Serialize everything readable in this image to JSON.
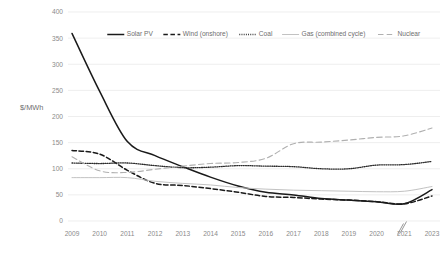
{
  "chart_data": {
    "type": "line",
    "title": "",
    "xlabel": "",
    "ylabel": "$/MWh",
    "ylim": [
      0,
      400
    ],
    "ytick_values": [
      0,
      50,
      100,
      150,
      200,
      250,
      300,
      350,
      400
    ],
    "ytick_labels": [
      "0",
      "50",
      "100",
      "150",
      "200",
      "250",
      "300",
      "350",
      "400"
    ],
    "grid": true,
    "legend_position": "top",
    "axis_break": {
      "label": "zigzag-break",
      "between": [
        "2021",
        "2023"
      ]
    },
    "categories": [
      "2009",
      "2010",
      "2011",
      "2012",
      "2013",
      "2014",
      "2015",
      "2016",
      "2017",
      "2018",
      "2019",
      "2020",
      "2021",
      "2023"
    ],
    "x": [
      2009,
      2010,
      2011,
      2012,
      2013,
      2014,
      2015,
      2016,
      2017,
      2018,
      2019,
      2020,
      2021,
      2023
    ],
    "series": [
      {
        "name": "Solar PV",
        "style": "solid",
        "color": "#1a1a1a",
        "values": [
          359,
          248,
          152,
          125,
          104,
          84,
          67,
          55,
          50,
          43,
          40,
          37,
          33,
          60
        ]
      },
      {
        "name": "Wind (onshore)",
        "style": "dashed",
        "color": "#1a1a1a",
        "values": [
          135,
          128,
          97,
          72,
          68,
          62,
          55,
          47,
          45,
          42,
          40,
          37,
          33,
          48
        ]
      },
      {
        "name": "Coal",
        "style": "dotted",
        "color": "#2b2b2b",
        "values": [
          111,
          110,
          111,
          106,
          102,
          103,
          106,
          105,
          104,
          100,
          100,
          107,
          108,
          114
        ]
      },
      {
        "name": "Gas (combined cycle)",
        "style": "solid",
        "color": "#c2c2c2",
        "values": [
          83,
          83,
          83,
          76,
          72,
          69,
          64,
          61,
          59,
          58,
          57,
          56,
          57,
          66
        ]
      },
      {
        "name": "Nuclear",
        "style": "long-dashed",
        "color": "#b0b0b0",
        "values": [
          123,
          96,
          93,
          99,
          105,
          110,
          112,
          120,
          148,
          151,
          155,
          160,
          163,
          178
        ]
      }
    ]
  },
  "legend": {
    "items": [
      {
        "label": "Solar PV"
      },
      {
        "label": "Wind (onshore)"
      },
      {
        "label": "Coal"
      },
      {
        "label": "Gas (combined cycle)"
      },
      {
        "label": "Nuclear"
      }
    ]
  }
}
